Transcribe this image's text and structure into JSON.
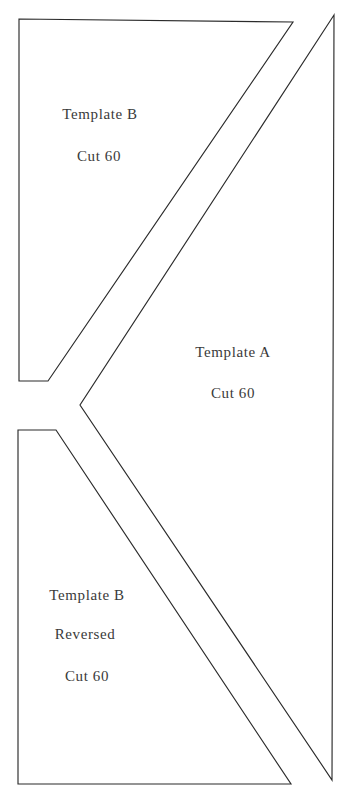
{
  "sheet": {
    "title": "Quilt Pattern Template Sheet",
    "background_color": "#ffffff",
    "line_color": "#2b2b2b",
    "text_color": "#3a3a3a",
    "width": 345,
    "height": 794
  },
  "pieces": [
    {
      "id": "template-b",
      "name": "Template B",
      "lines": [
        "Template B",
        "Cut 60"
      ],
      "label_name": "Template B",
      "label_cut": "Cut 60",
      "quantity": 60,
      "shape": "quadrilateral",
      "points": "19,19 293,22 48,381 19,381"
    },
    {
      "id": "template-a",
      "name": "Template A",
      "lines": [
        "Template A",
        "Cut 60"
      ],
      "label_name": "Template A",
      "label_cut": "Cut 60",
      "quantity": 60,
      "shape": "chevron",
      "points": "334,15 80,405 332,780"
    },
    {
      "id": "template-b-reversed",
      "name": "Template B Reversed",
      "lines": [
        "Template B",
        "Reversed",
        "Cut 60"
      ],
      "label_name": "Template B",
      "label_reversed": "Reversed",
      "label_cut": "Cut 60",
      "quantity": 60,
      "shape": "quadrilateral",
      "points": "18,430 56,430 291,784 18,784"
    }
  ],
  "labels": {
    "template_b_name": "Template B",
    "template_b_cut": "Cut 60",
    "template_a_name": "Template A",
    "template_a_cut": "Cut 60",
    "template_b_rev_name": "Template B",
    "template_b_rev_reversed": "Reversed",
    "template_b_rev_cut": "Cut 60"
  }
}
